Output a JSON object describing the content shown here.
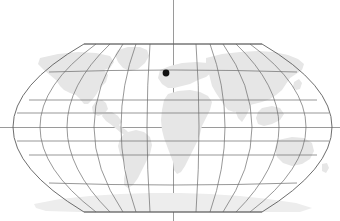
{
  "view": {
    "title": "World map",
    "width": 340,
    "height": 221,
    "background_color": "#ffffff"
  },
  "map": {
    "projection": "robinson",
    "land_color": "#e6e6e6",
    "graticule_color": "#6b6b6b",
    "frame_color": "#5c5c5c",
    "crosshair_color": "#9a9a9a",
    "frame": {
      "left_x": 13,
      "right_x": 332,
      "top_y": 44,
      "bottom_y": 212,
      "center_x": 173,
      "equator_y": 127
    },
    "graticule": {
      "meridian_step_degrees": 30,
      "parallel_step_degrees": 20,
      "meridian_longitudes": [
        -180,
        -150,
        -120,
        -90,
        -60,
        -30,
        0,
        30,
        60,
        90,
        120,
        150,
        180
      ],
      "parallel_latitudes": [
        80,
        60,
        40,
        20,
        0,
        -20,
        -40,
        -60,
        -80
      ]
    },
    "crosshair": {
      "vertical_x": 173,
      "horizontal_y": 127,
      "label": "center-crosshair"
    },
    "landmasses": [
      "north-america",
      "south-america",
      "europe",
      "africa",
      "asia",
      "australia",
      "antarctica",
      "greenland"
    ]
  },
  "markers": [
    {
      "name": "location-marker",
      "x": 166,
      "y": 73,
      "radius": 3.4,
      "color": "#111111",
      "latitude": 52,
      "longitude": -5
    }
  ]
}
